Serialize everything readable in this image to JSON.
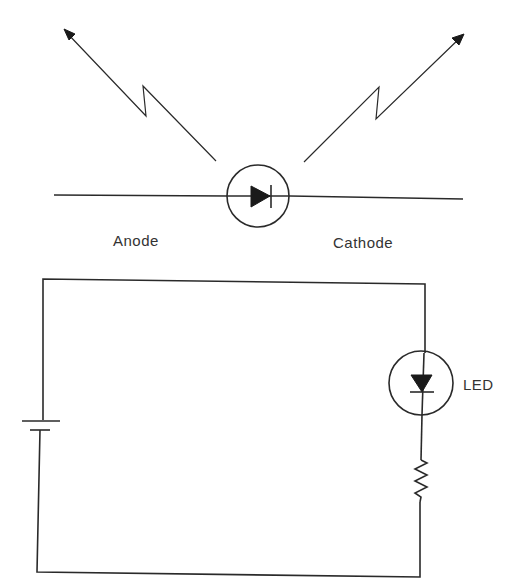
{
  "figure": {
    "top_symbol": {
      "description": "LED symbol with light-emission arrows",
      "labels": {
        "anode": "Anode",
        "cathode": "Cathode"
      }
    },
    "circuit": {
      "description": "Battery, LED and resistor in series",
      "labels": {
        "led": "LED"
      },
      "components": [
        "battery-icon",
        "led-icon",
        "resistor-icon"
      ]
    },
    "colors": {
      "line": "#2a2a2a",
      "text": "#333333",
      "background": "#ffffff"
    }
  }
}
